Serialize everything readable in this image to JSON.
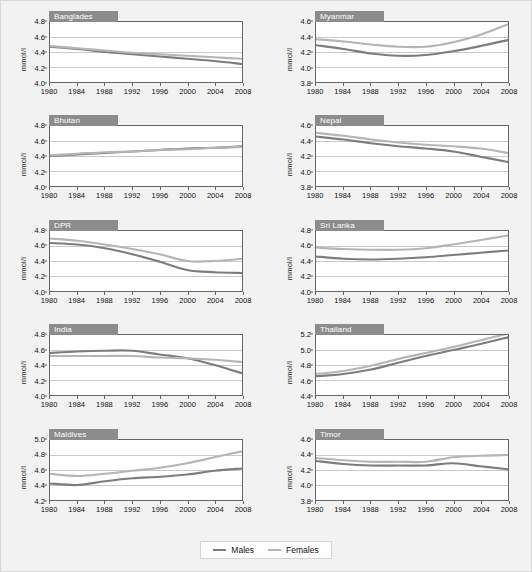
{
  "figure": {
    "background": "#f2f2f2",
    "ylabel": "mmol/l",
    "xticks": [
      1980,
      1984,
      1988,
      1992,
      1996,
      2000,
      2004,
      2008
    ],
    "xlim": [
      1980,
      2008
    ]
  },
  "legend": {
    "males_label": "Males",
    "females_label": "Females",
    "males_color": "#7d7d7d",
    "females_color": "#b5b5b5"
  },
  "chart_data": [
    {
      "type": "line",
      "title": "Banglades",
      "xlabel": "",
      "ylabel": "mmol/l",
      "x": [
        1980,
        1984,
        1988,
        1992,
        1996,
        2000,
        2004,
        2008
      ],
      "xlim": [
        1980,
        2008
      ],
      "ylim": [
        4.0,
        4.8
      ],
      "yticks": [
        4.0,
        4.2,
        4.4,
        4.6,
        4.8
      ],
      "grid": true,
      "series": [
        {
          "name": "Males",
          "color": "#7d7d7d",
          "values": [
            4.47,
            4.44,
            4.4,
            4.37,
            4.34,
            4.31,
            4.28,
            4.24
          ]
        },
        {
          "name": "Females",
          "color": "#b5b5b5",
          "values": [
            4.48,
            4.45,
            4.42,
            4.39,
            4.37,
            4.35,
            4.33,
            4.31
          ]
        }
      ]
    },
    {
      "type": "line",
      "title": "Myanmar",
      "xlabel": "",
      "ylabel": "mmol/l",
      "x": [
        1980,
        1984,
        1988,
        1992,
        1996,
        2000,
        2004,
        2008
      ],
      "xlim": [
        1980,
        2008
      ],
      "ylim": [
        3.8,
        4.6
      ],
      "yticks": [
        3.8,
        4.0,
        4.2,
        4.4,
        4.6
      ],
      "grid": true,
      "series": [
        {
          "name": "Males",
          "color": "#7d7d7d",
          "values": [
            4.29,
            4.24,
            4.18,
            4.15,
            4.16,
            4.21,
            4.28,
            4.36
          ]
        },
        {
          "name": "Females",
          "color": "#b5b5b5",
          "values": [
            4.37,
            4.34,
            4.3,
            4.27,
            4.27,
            4.33,
            4.43,
            4.57
          ]
        }
      ]
    },
    {
      "type": "line",
      "title": "Bhutan",
      "xlabel": "",
      "ylabel": "mmol/l",
      "x": [
        1980,
        1984,
        1988,
        1992,
        1996,
        2000,
        2004,
        2008
      ],
      "xlim": [
        1980,
        2008
      ],
      "ylim": [
        4.0,
        4.8
      ],
      "yticks": [
        4.0,
        4.2,
        4.4,
        4.6,
        4.8
      ],
      "grid": true,
      "series": [
        {
          "name": "Males",
          "color": "#7d7d7d",
          "values": [
            4.4,
            4.42,
            4.44,
            4.46,
            4.48,
            4.5,
            4.51,
            4.53
          ]
        },
        {
          "name": "Females",
          "color": "#b5b5b5",
          "values": [
            4.41,
            4.43,
            4.45,
            4.46,
            4.48,
            4.49,
            4.51,
            4.52
          ]
        }
      ]
    },
    {
      "type": "line",
      "title": "Nepal",
      "xlabel": "",
      "ylabel": "mmol/l",
      "x": [
        1980,
        1984,
        1988,
        1992,
        1996,
        2000,
        2004,
        2008
      ],
      "xlim": [
        3.8,
        4.6
      ],
      "ylim": [
        3.8,
        4.6
      ],
      "yticks": [
        3.8,
        4.0,
        4.2,
        4.4,
        4.6
      ],
      "grid": true,
      "series": [
        {
          "name": "Males",
          "color": "#7d7d7d",
          "values": [
            4.46,
            4.42,
            4.37,
            4.33,
            4.3,
            4.26,
            4.19,
            4.12
          ]
        },
        {
          "name": "Females",
          "color": "#b5b5b5",
          "values": [
            4.51,
            4.47,
            4.42,
            4.38,
            4.35,
            4.33,
            4.3,
            4.24
          ]
        }
      ]
    },
    {
      "type": "line",
      "title": "DPR",
      "xlabel": "",
      "ylabel": "mmol/l",
      "x": [
        1980,
        1984,
        1988,
        1992,
        1996,
        2000,
        2004,
        2008
      ],
      "xlim": [
        1980,
        2008
      ],
      "ylim": [
        4.0,
        4.8
      ],
      "yticks": [
        4.0,
        4.2,
        4.4,
        4.6,
        4.8
      ],
      "grid": true,
      "series": [
        {
          "name": "Males",
          "color": "#7d7d7d",
          "values": [
            4.64,
            4.62,
            4.57,
            4.49,
            4.39,
            4.28,
            4.25,
            4.24
          ]
        },
        {
          "name": "Females",
          "color": "#b5b5b5",
          "values": [
            4.7,
            4.67,
            4.62,
            4.56,
            4.49,
            4.4,
            4.4,
            4.43
          ]
        }
      ]
    },
    {
      "type": "line",
      "title": "Sri Lanka",
      "xlabel": "",
      "ylabel": "mmol/l",
      "x": [
        1980,
        1984,
        1988,
        1992,
        1996,
        2000,
        2004,
        2008
      ],
      "xlim": [
        1980,
        2008
      ],
      "ylim": [
        4.0,
        4.8
      ],
      "yticks": [
        4.0,
        4.2,
        4.4,
        4.6,
        4.8
      ],
      "grid": true,
      "series": [
        {
          "name": "Males",
          "color": "#7d7d7d",
          "values": [
            4.46,
            4.43,
            4.42,
            4.43,
            4.45,
            4.48,
            4.51,
            4.54
          ]
        },
        {
          "name": "Females",
          "color": "#b5b5b5",
          "values": [
            4.58,
            4.56,
            4.55,
            4.55,
            4.57,
            4.62,
            4.68,
            4.74
          ]
        }
      ]
    },
    {
      "type": "line",
      "title": "India",
      "xlabel": "",
      "ylabel": "mmol/l",
      "x": [
        1980,
        1984,
        1988,
        1992,
        1996,
        2000,
        2004,
        2008
      ],
      "xlim": [
        1980,
        2008
      ],
      "ylim": [
        4.0,
        4.8
      ],
      "yticks": [
        4.0,
        4.2,
        4.4,
        4.6,
        4.8
      ],
      "grid": true,
      "series": [
        {
          "name": "Males",
          "color": "#7d7d7d",
          "values": [
            4.56,
            4.58,
            4.59,
            4.59,
            4.54,
            4.49,
            4.4,
            4.29
          ]
        },
        {
          "name": "Females",
          "color": "#b5b5b5",
          "values": [
            4.52,
            4.52,
            4.52,
            4.52,
            4.5,
            4.49,
            4.47,
            4.44
          ]
        }
      ]
    },
    {
      "type": "line",
      "title": "Thailand",
      "xlabel": "",
      "ylabel": "mmol/l",
      "x": [
        1980,
        1984,
        1988,
        1992,
        1996,
        2000,
        2004,
        2008
      ],
      "xlim": [
        1980,
        2008
      ],
      "ylim": [
        4.4,
        5.2
      ],
      "yticks": [
        4.4,
        4.6,
        4.8,
        5.0,
        5.2
      ],
      "grid": true,
      "series": [
        {
          "name": "Males",
          "color": "#7d7d7d",
          "values": [
            4.65,
            4.68,
            4.74,
            4.83,
            4.92,
            5.0,
            5.08,
            5.17
          ]
        },
        {
          "name": "Females",
          "color": "#b5b5b5",
          "values": [
            4.68,
            4.72,
            4.79,
            4.88,
            4.96,
            5.04,
            5.13,
            5.22
          ]
        }
      ]
    },
    {
      "type": "line",
      "title": "Maldives",
      "xlabel": "",
      "ylabel": "mmol/l",
      "x": [
        1980,
        1984,
        1988,
        1992,
        1996,
        2000,
        2004,
        2008
      ],
      "xlim": [
        1980,
        2008
      ],
      "ylim": [
        4.2,
        5.0
      ],
      "yticks": [
        4.2,
        4.4,
        4.6,
        4.8,
        5.0
      ],
      "grid": true,
      "series": [
        {
          "name": "Males",
          "color": "#7d7d7d",
          "values": [
            4.42,
            4.4,
            4.45,
            4.49,
            4.51,
            4.54,
            4.59,
            4.62
          ]
        },
        {
          "name": "Females",
          "color": "#b5b5b5",
          "values": [
            4.55,
            4.52,
            4.55,
            4.59,
            4.63,
            4.69,
            4.77,
            4.85
          ]
        }
      ]
    },
    {
      "type": "line",
      "title": "Timor",
      "xlabel": "",
      "ylabel": "mmol/l",
      "x": [
        1980,
        1984,
        1988,
        1992,
        1996,
        2000,
        2004,
        2008
      ],
      "xlim": [
        1980,
        2008
      ],
      "ylim": [
        3.8,
        4.6
      ],
      "yticks": [
        3.8,
        4.0,
        4.2,
        4.4,
        4.6
      ],
      "grid": true,
      "series": [
        {
          "name": "Males",
          "color": "#7d7d7d",
          "values": [
            4.32,
            4.28,
            4.26,
            4.26,
            4.26,
            4.29,
            4.25,
            4.21
          ]
        },
        {
          "name": "Females",
          "color": "#b5b5b5",
          "values": [
            4.36,
            4.33,
            4.31,
            4.31,
            4.31,
            4.37,
            4.39,
            4.4
          ]
        }
      ]
    }
  ]
}
